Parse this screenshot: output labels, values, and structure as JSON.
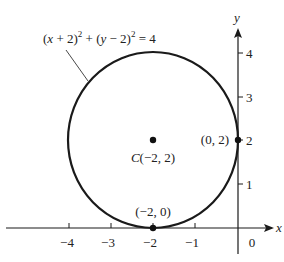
{
  "diagram": {
    "type": "circle-on-coordinate-plane",
    "equation": {
      "part1": "(",
      "var_x": "x",
      "part2": " + 2)",
      "exp1": "2",
      "part3": " + (",
      "var_y": "y",
      "part4": " − 2)",
      "exp2": "2",
      "part5": " = 4"
    },
    "center_label": {
      "prefix": "C",
      "coords": "(−2, 2)"
    },
    "point_right": "(0, 2)",
    "point_bottom": "(−2, 0)",
    "axes": {
      "x_label": "x",
      "y_label": "y",
      "x_ticks": [
        "−4",
        "−3",
        "−2",
        "−1"
      ],
      "origin_label": "0",
      "y_ticks": [
        "1",
        "2",
        "3",
        "4"
      ]
    },
    "colors": {
      "stroke": "#1a1a1a",
      "text": "#222222"
    }
  }
}
